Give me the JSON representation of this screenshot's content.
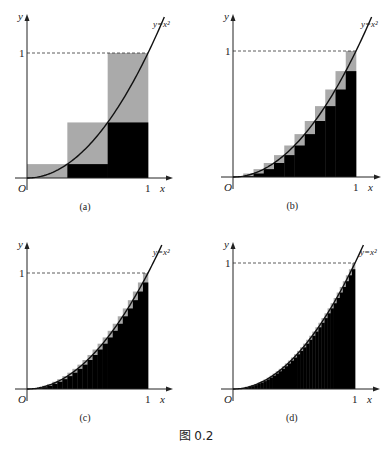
{
  "figure_caption": "图 0.2",
  "chart_data": [
    {
      "type": "bar",
      "panel": "a",
      "caption": "(a)",
      "n": 3,
      "function": "y=x^2",
      "xlabel": "x",
      "ylabel": "y",
      "origin_label": "O",
      "xticks": [
        "1"
      ],
      "yticks": [
        "1"
      ],
      "xlim": [
        0,
        1
      ],
      "ylim": [
        0,
        1
      ],
      "lower_sum_color": "#000000",
      "upper_sum_color": "#aaaaaa"
    },
    {
      "type": "bar",
      "panel": "b",
      "caption": "(b)",
      "n": 12,
      "function": "y=x^2",
      "xlabel": "x",
      "ylabel": "y",
      "origin_label": "O",
      "xticks": [
        "1"
      ],
      "yticks": [
        "1"
      ],
      "xlim": [
        0,
        1
      ],
      "ylim": [
        0,
        1
      ],
      "lower_sum_color": "#000000",
      "upper_sum_color": "#aaaaaa"
    },
    {
      "type": "bar",
      "panel": "c",
      "caption": "(c)",
      "n": 24,
      "function": "y=x^2",
      "xlabel": "x",
      "ylabel": "y",
      "origin_label": "O",
      "xticks": [
        "1"
      ],
      "yticks": [
        "1"
      ],
      "xlim": [
        0,
        1
      ],
      "ylim": [
        0,
        1
      ],
      "lower_sum_color": "#000000",
      "upper_sum_color": "#aaaaaa"
    },
    {
      "type": "bar",
      "panel": "d",
      "caption": "(d)",
      "n": 40,
      "function": "y=x^2",
      "xlabel": "x",
      "ylabel": "y",
      "origin_label": "O",
      "xticks": [
        "1"
      ],
      "yticks": [
        "1"
      ],
      "xlim": [
        0,
        1
      ],
      "ylim": [
        0,
        1
      ],
      "lower_sum_color": "#000000",
      "upper_sum_color": "#aaaaaa"
    }
  ],
  "labels": {
    "curve": "y=x²",
    "x": "x",
    "y": "y",
    "origin": "O",
    "one": "1"
  }
}
